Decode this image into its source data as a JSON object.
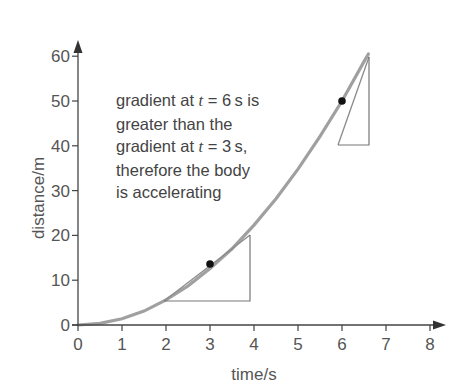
{
  "chart_data": {
    "type": "line",
    "title": "",
    "xlabel": "time/s",
    "ylabel": "distance/m",
    "xlim": [
      0,
      8
    ],
    "ylim": [
      0,
      60
    ],
    "x_ticks": [
      0,
      1,
      2,
      3,
      4,
      5,
      6,
      7,
      8
    ],
    "y_ticks": [
      0,
      10,
      20,
      30,
      40,
      50,
      60
    ],
    "grid": false,
    "legend": null,
    "series": [
      {
        "name": "distance-time curve",
        "x": [
          0,
          0.5,
          1,
          1.5,
          2,
          2.5,
          3,
          3.5,
          4,
          4.5,
          5,
          5.5,
          6,
          6.5,
          6.6
        ],
        "values": [
          0,
          0.35,
          1.4,
          3.1,
          5.6,
          8.7,
          12.6,
          17.0,
          22.3,
          28.2,
          34.8,
          42.1,
          50.0,
          58.8,
          60.5
        ]
      }
    ],
    "points": [
      {
        "label": "t = 3 s",
        "x": 3,
        "y": 13.6
      },
      {
        "label": "t = 6 s",
        "x": 6,
        "y": 50
      }
    ],
    "tangent_triangles": [
      {
        "at_t": 3,
        "x_from": 1.95,
        "x_to": 3.9,
        "y_from": 5.3,
        "y_to": 20
      },
      {
        "at_t": 6,
        "x_from": 5.45,
        "x_to": 6.6,
        "y_from": 40,
        "y_to": 59.8
      }
    ],
    "annotations": [
      "gradient at t = 6 s is greater than the gradient at t = 3 s, therefore the body is accelerating"
    ]
  },
  "annotation": {
    "line1_a": "gradient at ",
    "line1_t": "t",
    "line1_b": " = 6 s is",
    "line2": "greater than the",
    "line3_a": "gradient at ",
    "line3_t": "t",
    "line3_b": " = 3 s,",
    "line4": "therefore the body",
    "line5": "is accelerating"
  },
  "axes": {
    "xlabel": "time/s",
    "ylabel": "distance/m",
    "x_tick_labels": [
      "0",
      "1",
      "2",
      "3",
      "4",
      "5",
      "6",
      "7",
      "8"
    ],
    "y_tick_labels": [
      "0",
      "10",
      "20",
      "30",
      "40",
      "50",
      "60"
    ]
  },
  "colors": {
    "axis": "#444444",
    "curve": "#9a9a9a",
    "tangent": "#777777",
    "dot": "#111111",
    "text": "#555555"
  }
}
